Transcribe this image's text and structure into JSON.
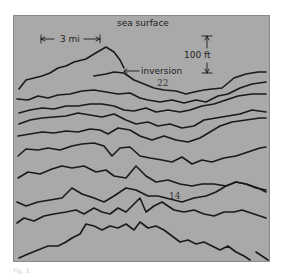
{
  "figure": {
    "background_color": "#a9a9a9",
    "line_color": "#1a1a1a",
    "labels": {
      "top": "sea surface",
      "horizontal_scale": "3 mi",
      "vertical_scale": "100 ft",
      "annotation": "inversion",
      "value_upper": "22",
      "value_lower": "14"
    }
  },
  "caption": "Fig. 3."
}
